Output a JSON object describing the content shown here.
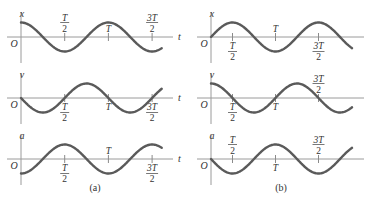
{
  "figure": {
    "panels": [
      {
        "id": "a",
        "caption": "(a)",
        "origin_label": "O",
        "time_axis_label": "t",
        "time_range_periods": [
          0,
          1.61
        ],
        "plots": [
          {
            "quantity": "x",
            "function": "cos",
            "ticks": [
              {
                "at_periods": 0.5,
                "num": "T",
                "den": "2",
                "side": "above"
              },
              {
                "at_periods": 1.0,
                "num": "T",
                "den": null,
                "side": "above"
              },
              {
                "at_periods": 1.5,
                "num": "3T",
                "den": "2",
                "side": "above"
              }
            ]
          },
          {
            "quantity": "v",
            "function": "-sin",
            "ticks": [
              {
                "at_periods": 0.5,
                "num": "T",
                "den": "2",
                "side": "below"
              },
              {
                "at_periods": 1.0,
                "num": "T",
                "den": null,
                "side": "below"
              },
              {
                "at_periods": 1.5,
                "num": "3T",
                "den": "2",
                "side": "below"
              }
            ]
          },
          {
            "quantity": "a",
            "function": "-cos",
            "ticks": [
              {
                "at_periods": 0.5,
                "num": "T",
                "den": "2",
                "side": "below"
              },
              {
                "at_periods": 1.0,
                "num": "T",
                "den": null,
                "side": "above"
              },
              {
                "at_periods": 1.5,
                "num": "3T",
                "den": "2",
                "side": "below"
              }
            ]
          }
        ]
      },
      {
        "id": "b",
        "caption": "(b)",
        "origin_label": "O",
        "time_axis_label": null,
        "time_range_periods": [
          0,
          1.64
        ],
        "plots": [
          {
            "quantity": "x",
            "function": "sin",
            "ticks": [
              {
                "at_periods": 0.25,
                "num": "T",
                "den": "2",
                "side": "below"
              },
              {
                "at_periods": 0.75,
                "num": "T",
                "den": null,
                "side": "above"
              },
              {
                "at_periods": 1.25,
                "num": "3T",
                "den": "2",
                "side": "below"
              }
            ]
          },
          {
            "quantity": "v",
            "function": "cos",
            "ticks": [
              {
                "at_periods": 0.25,
                "num": "T",
                "den": "2",
                "side": "below"
              },
              {
                "at_periods": 0.75,
                "num": "T",
                "den": null,
                "side": "below"
              },
              {
                "at_periods": 1.25,
                "num": "3T",
                "den": "2",
                "side": "above"
              }
            ]
          },
          {
            "quantity": "a",
            "function": "-sin",
            "ticks": [
              {
                "at_periods": 0.25,
                "num": "T",
                "den": "2",
                "side": "above"
              },
              {
                "at_periods": 0.75,
                "num": "T",
                "den": null,
                "side": "below"
              },
              {
                "at_periods": 1.25,
                "num": "3T",
                "den": "2",
                "side": "above"
              }
            ]
          }
        ]
      }
    ],
    "colors": {
      "curve": "#5a5a5a",
      "axis": "#9a9a9a",
      "text": "#333333"
    }
  }
}
